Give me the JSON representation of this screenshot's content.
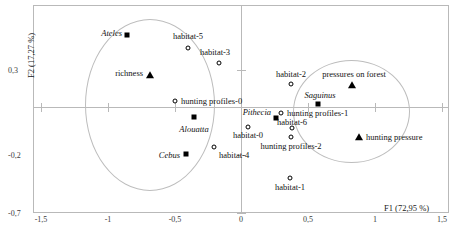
{
  "chart_data": {
    "type": "scatter",
    "title": "",
    "xlabel": "F1 (72,95 %)",
    "ylabel": "F2 (17,27 %)",
    "xlim": [
      -1.5,
      1.5
    ],
    "ylim": [
      -0.7,
      0.55
    ],
    "xticks": [
      "-1,5",
      "-1",
      "-0,5",
      "0",
      "0,5",
      "1",
      "1,5"
    ],
    "xtick_values": [
      -1.5,
      -1,
      -0.5,
      0,
      0.5,
      1,
      1.5
    ],
    "yticks": [
      "0,3",
      "-0,2",
      "-0,7"
    ],
    "ytick_values": [
      0.3,
      -0.2,
      -0.7
    ],
    "grid": false,
    "legend": "none",
    "marker_semantics": {
      "square": "genus (italic label)",
      "circle": "habitat / hunting profile category",
      "triangle": "supplementary variable"
    },
    "annotations": [
      {
        "shape": "ellipse",
        "name": "left-cluster-ellipse",
        "cx": -0.655,
        "cy": -0.088,
        "rx": 0.475,
        "ry": 0.505
      },
      {
        "shape": "ellipse",
        "name": "right-cluster-ellipse",
        "cx": 0.795,
        "cy": -0.112,
        "rx": 0.42,
        "ry": 0.3
      }
    ],
    "points": [
      {
        "label": "Ateles",
        "x": -0.82,
        "y": 0.425,
        "marker": "square",
        "italic": true,
        "lab_pos": "left"
      },
      {
        "label": "habitat-5",
        "x": -0.4,
        "y": 0.345,
        "marker": "circle",
        "italic": false,
        "lab_pos": "above"
      },
      {
        "label": "habitat-3",
        "x": -0.16,
        "y": 0.255,
        "marker": "circle",
        "italic": false,
        "lab_pos": "above"
      },
      {
        "label": "richness",
        "x": -0.68,
        "y": 0.185,
        "marker": "triangle",
        "italic": false,
        "lab_pos": "left"
      },
      {
        "label": "hunting profiles-0",
        "x": -0.5,
        "y": 0.035,
        "marker": "circle",
        "italic": false,
        "lab_pos": "right"
      },
      {
        "label": "Alouatta",
        "x": -0.355,
        "y": -0.058,
        "marker": "square",
        "italic": true,
        "lab_pos": "below"
      },
      {
        "label": "Cebus",
        "x": -0.415,
        "y": -0.275,
        "marker": "square",
        "italic": true,
        "lab_pos": "left"
      },
      {
        "label": "habitat-4",
        "x": -0.2,
        "y": -0.235,
        "marker": "circle",
        "italic": false,
        "lab_pos": "below-right"
      },
      {
        "label": "habitat-2",
        "x": 0.375,
        "y": 0.135,
        "marker": "circle",
        "italic": false,
        "lab_pos": "above"
      },
      {
        "label": "pressures on forest",
        "x": 0.815,
        "y": 0.135,
        "marker": "triangle",
        "italic": false,
        "lab_pos": "above"
      },
      {
        "label": "Saguinus",
        "x": 0.575,
        "y": 0.02,
        "marker": "square",
        "italic": true,
        "lab_pos": "above"
      },
      {
        "label": "hunting profiles-1",
        "x": 0.545,
        "y": 0.0,
        "marker": "circle",
        "italic": false,
        "lab_pos": "right"
      },
      {
        "label": "Pithecia",
        "x": 0.515,
        "y": -0.03,
        "marker": "square",
        "italic": true,
        "lab_pos": "left"
      },
      {
        "label": "habitat-6",
        "x": 0.585,
        "y": -0.08,
        "marker": "circle",
        "italic": false,
        "lab_pos": "above"
      },
      {
        "label": "habitat-0",
        "x": 0.325,
        "y": -0.075,
        "marker": "circle",
        "italic": false,
        "lab_pos": "below"
      },
      {
        "label": "hunting profiles-2",
        "x": 0.575,
        "y": -0.125,
        "marker": "circle",
        "italic": false,
        "lab_pos": "below"
      },
      {
        "label": "hunting pressure",
        "x": 0.86,
        "y": -0.125,
        "marker": "triangle",
        "italic": false,
        "lab_pos": "right"
      },
      {
        "label": "habitat-1",
        "x": 0.565,
        "y": -0.365,
        "marker": "circle",
        "italic": false,
        "lab_pos": "below"
      }
    ]
  },
  "geometry": {
    "frame": {
      "left": 33,
      "top": 5,
      "width": 416,
      "height": 208
    },
    "origin_px": {
      "x": 241,
      "y": 107
    },
    "scale_px": {
      "x_per_unit": 133.6,
      "y_per_unit": 170.0
    },
    "xtick_px": [
      41,
      108,
      175,
      241,
      308,
      375,
      442
    ],
    "ytick_px": [
      70,
      155,
      213
    ],
    "ellipses": [
      {
        "name": "left-cluster-ellipse",
        "left": 85,
        "top": 19,
        "width": 130,
        "height": 172
      },
      {
        "name": "right-cluster-ellipse",
        "left": 293,
        "top": 60,
        "width": 117,
        "height": 103
      }
    ],
    "points_px": [
      {
        "x": 127,
        "y": 35,
        "lx": 122,
        "ly": 33
      },
      {
        "x": 188,
        "y": 48,
        "lx": 188,
        "ly": 36
      },
      {
        "x": 219,
        "y": 63,
        "lx": 215,
        "ly": 52
      },
      {
        "x": 150,
        "y": 75,
        "lx": 143,
        "ly": 73
      },
      {
        "x": 175,
        "y": 101,
        "lx": 181,
        "ly": 101
      },
      {
        "x": 194,
        "y": 117,
        "lx": 194,
        "ly": 129
      },
      {
        "x": 186,
        "y": 154,
        "lx": 180,
        "ly": 155
      },
      {
        "x": 214,
        "y": 147,
        "lx": 219,
        "ly": 155
      },
      {
        "x": 291,
        "y": 84,
        "lx": 291,
        "ly": 74
      },
      {
        "x": 352,
        "y": 85,
        "lx": 354,
        "ly": 74
      },
      {
        "x": 318,
        "y": 104,
        "lx": 320,
        "ly": 95
      },
      {
        "x": 281,
        "y": 113,
        "lx": 287,
        "ly": 113
      },
      {
        "x": 276,
        "y": 118,
        "lx": 271,
        "ly": 112
      },
      {
        "x": 292,
        "y": 128,
        "lx": 292,
        "ly": 122
      },
      {
        "x": 248,
        "y": 127,
        "lx": 248,
        "ly": 135
      },
      {
        "x": 291,
        "y": 137,
        "lx": 291,
        "ly": 146
      },
      {
        "x": 359,
        "y": 137,
        "lx": 366,
        "ly": 137
      },
      {
        "x": 290,
        "y": 178,
        "lx": 290,
        "ly": 187
      }
    ]
  }
}
